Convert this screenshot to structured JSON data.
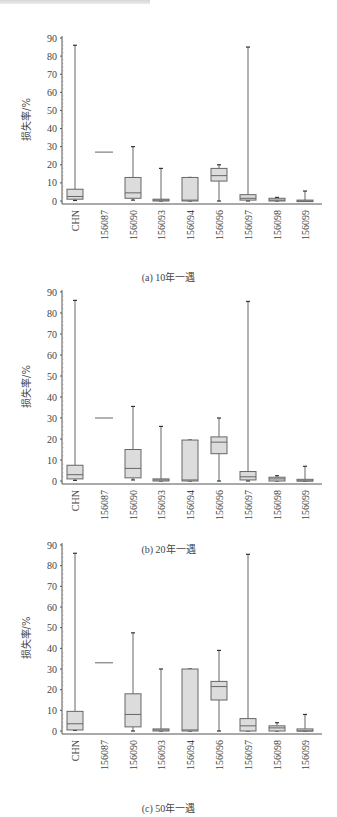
{
  "header": {
    "text": ""
  },
  "chart_data": [
    {
      "type": "box",
      "title": "(a) 10年一遇",
      "xlabel": "",
      "ylabel": "损失率/%",
      "ylim": [
        0,
        90
      ],
      "yticks": [
        0,
        10,
        20,
        30,
        40,
        50,
        60,
        70,
        80,
        90
      ],
      "grid": false,
      "categories": [
        "CHN",
        "156087",
        "156090",
        "156093",
        "156094",
        "156096",
        "156097",
        "156098",
        "156099"
      ],
      "boxes": [
        {
          "min": 0.3,
          "q1": 1,
          "median": 2.5,
          "q3": 6.5,
          "max": 86
        },
        {
          "min": 27,
          "q1": 27,
          "median": 27,
          "q3": 27,
          "max": 27
        },
        {
          "min": 0.5,
          "q1": 1.5,
          "median": 4.5,
          "q3": 13,
          "max": 30
        },
        {
          "min": 0,
          "q1": 0,
          "median": 0.5,
          "q3": 1,
          "max": 18
        },
        {
          "min": 0,
          "q1": 0,
          "median": 0.5,
          "q3": 13,
          "max": 13
        },
        {
          "min": 0,
          "q1": 11,
          "median": 14,
          "q3": 18,
          "max": 20
        },
        {
          "min": 0,
          "q1": 0.5,
          "median": 1.5,
          "q3": 3.5,
          "max": 85
        },
        {
          "min": 0,
          "q1": 0,
          "median": 0.5,
          "q3": 1.5,
          "max": 2
        },
        {
          "min": 0,
          "q1": 0,
          "median": 0,
          "q3": 0.5,
          "max": 5.5
        }
      ]
    },
    {
      "type": "box",
      "title": "(b) 20年一遇",
      "xlabel": "",
      "ylabel": "损失率/%",
      "ylim": [
        0,
        90
      ],
      "yticks": [
        0,
        10,
        20,
        30,
        40,
        50,
        60,
        70,
        80,
        90
      ],
      "grid": false,
      "categories": [
        "CHN",
        "156087",
        "156090",
        "156093",
        "156094",
        "156096",
        "156097",
        "156098",
        "156099"
      ],
      "boxes": [
        {
          "min": 0.3,
          "q1": 1,
          "median": 3,
          "q3": 7.5,
          "max": 86
        },
        {
          "min": 30,
          "q1": 30,
          "median": 30,
          "q3": 30,
          "max": 30
        },
        {
          "min": 0.5,
          "q1": 1.5,
          "median": 6,
          "q3": 15,
          "max": 35.5
        },
        {
          "min": 0,
          "q1": 0,
          "median": 0.5,
          "q3": 1,
          "max": 26
        },
        {
          "min": 0,
          "q1": 0,
          "median": 0.5,
          "q3": 19.5,
          "max": 19.5
        },
        {
          "min": 0,
          "q1": 13,
          "median": 18.5,
          "q3": 21,
          "max": 30
        },
        {
          "min": 0,
          "q1": 0.5,
          "median": 2,
          "q3": 4.5,
          "max": 85.5
        },
        {
          "min": 0,
          "q1": 0,
          "median": 1,
          "q3": 1.8,
          "max": 2.5
        },
        {
          "min": 0,
          "q1": 0,
          "median": 0,
          "q3": 0.8,
          "max": 7
        }
      ]
    },
    {
      "type": "box",
      "title": "(c) 50年一遇",
      "xlabel": "",
      "ylabel": "损失率/%",
      "ylim": [
        0,
        90
      ],
      "yticks": [
        0,
        10,
        20,
        30,
        40,
        50,
        60,
        70,
        80,
        90
      ],
      "grid": false,
      "categories": [
        "CHN",
        "156087",
        "156090",
        "156093",
        "156094",
        "156096",
        "156097",
        "156098",
        "156099"
      ],
      "boxes": [
        {
          "min": 0.3,
          "q1": 0.5,
          "median": 3.5,
          "q3": 9.5,
          "max": 86
        },
        {
          "min": 33,
          "q1": 33,
          "median": 33,
          "q3": 33,
          "max": 33
        },
        {
          "min": 0,
          "q1": 2,
          "median": 8,
          "q3": 18,
          "max": 47.5
        },
        {
          "min": 0,
          "q1": 0,
          "median": 0.5,
          "q3": 1,
          "max": 30
        },
        {
          "min": 0,
          "q1": 0,
          "median": 0.5,
          "q3": 30,
          "max": 30
        },
        {
          "min": 0,
          "q1": 15,
          "median": 21.5,
          "q3": 24,
          "max": 39
        },
        {
          "min": 0,
          "q1": 0,
          "median": 2.5,
          "q3": 6,
          "max": 85.5
        },
        {
          "min": 0,
          "q1": 0,
          "median": 1.5,
          "q3": 2.5,
          "max": 4
        },
        {
          "min": 0,
          "q1": 0,
          "median": 0,
          "q3": 1,
          "max": 8
        }
      ]
    }
  ],
  "colors": {
    "box_fill": "#dcdcdc",
    "box_stroke": "#666666",
    "axis": "#555555",
    "text": "#444444"
  }
}
